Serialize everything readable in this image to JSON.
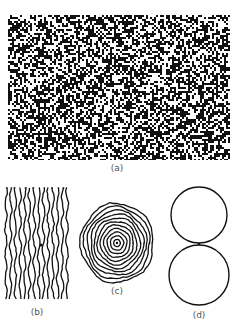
{
  "figure": {
    "panels": [
      {
        "id": "a",
        "label": "(a)",
        "description": "random speckle noise pattern"
      },
      {
        "id": "b",
        "label": "(b)",
        "description": "wavy vertical stripes"
      },
      {
        "id": "c",
        "label": "(c)",
        "description": "irregular concentric rings"
      },
      {
        "id": "d",
        "label": "(d)",
        "description": "two touching circles"
      }
    ]
  },
  "colors": {
    "ink": "#111111",
    "paper": "#ffffff",
    "label": "#555555"
  }
}
